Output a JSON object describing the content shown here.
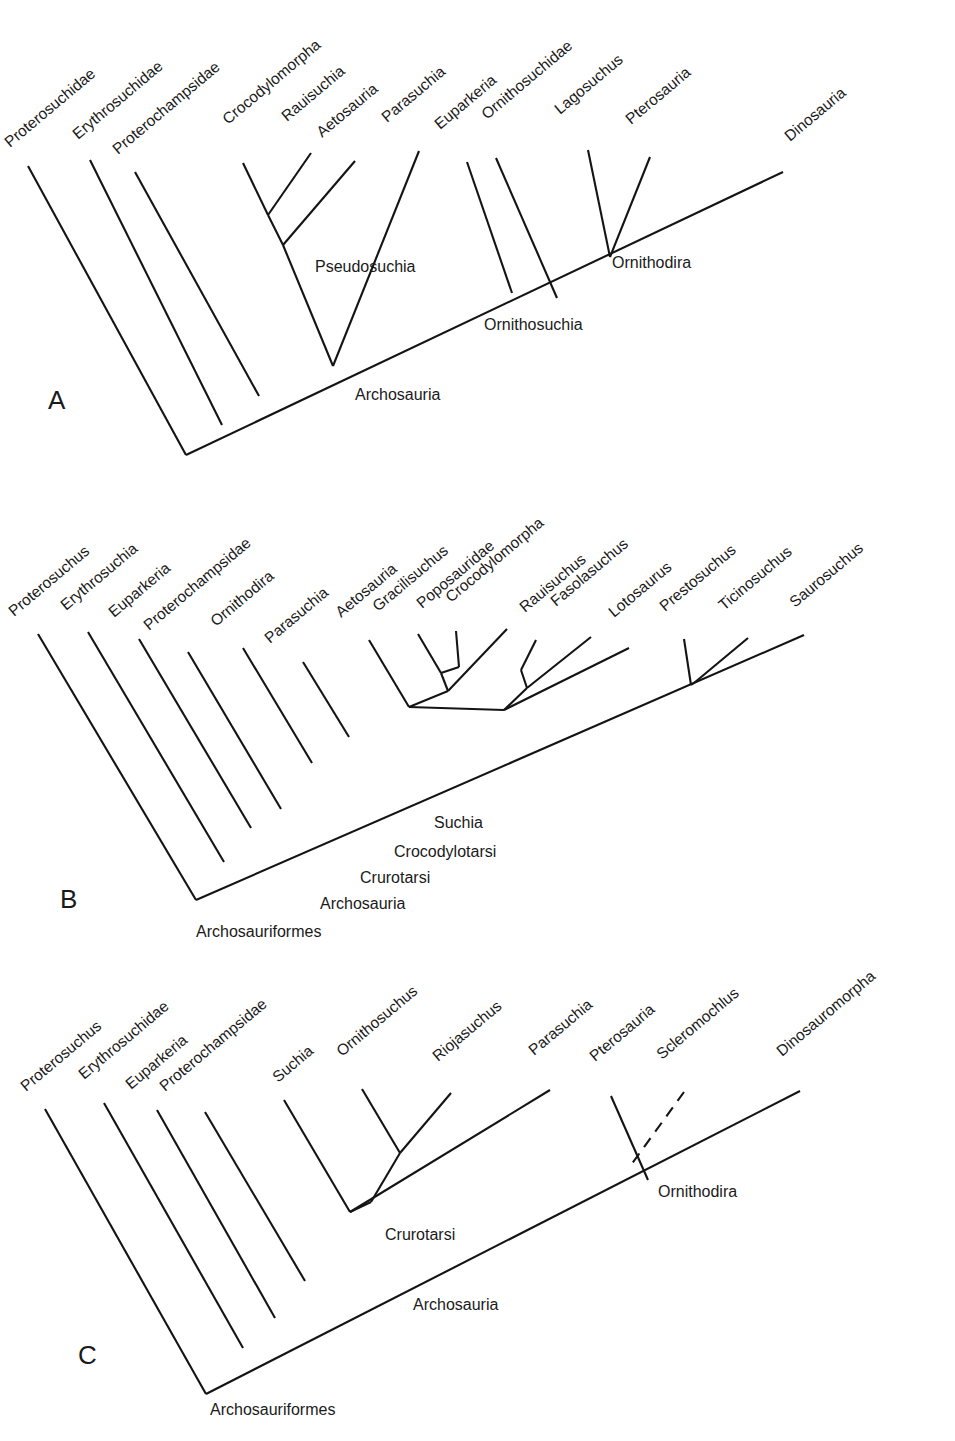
{
  "figure": {
    "type": "cladogram-figure",
    "panel_count": 3,
    "line_color": "#141414",
    "background": "#ffffff",
    "tip_label_rotation_deg": -40
  },
  "panels": [
    {
      "letter": "A",
      "letter_pos": {
        "x": 48,
        "y": 409
      },
      "tips": [
        {
          "label": "Proterosuchidae",
          "lx": 10,
          "ly": 148,
          "x1": 28,
          "y1": 166,
          "x2": 186,
          "y2": 455
        },
        {
          "label": "Erythrosuchidae",
          "lx": 78,
          "ly": 140,
          "x1": 90,
          "y1": 160,
          "x2": 222,
          "y2": 425
        },
        {
          "label": "Proterochampsidae",
          "lx": 118,
          "ly": 155,
          "x1": 135,
          "y1": 172,
          "x2": 259,
          "y2": 396
        },
        {
          "label": "Crocodylomorpha",
          "lx": 228,
          "ly": 125,
          "x1": 243,
          "y1": 163,
          "x2": 296,
          "y2": 263
        },
        {
          "label": "Rauisuchia",
          "lx": 287,
          "ly": 122,
          "x1": 311,
          "y1": 153,
          "x2": 268,
          "y2": 215
        },
        {
          "label": "Aetosauria",
          "lx": 322,
          "ly": 138,
          "x1": 355,
          "y1": 161,
          "x2": 283,
          "y2": 245
        },
        {
          "label": "Parasuchia",
          "lx": 387,
          "ly": 123,
          "x1": 419,
          "y1": 151,
          "x2": 333,
          "y2": 366
        },
        {
          "label": "Euparkeria",
          "lx": 440,
          "ly": 130,
          "x1": 467,
          "y1": 162,
          "x2": 512,
          "y2": 293
        },
        {
          "label": "Ornithosuchidae",
          "lx": 487,
          "ly": 120,
          "x1": 496,
          "y1": 158,
          "x2": 557,
          "y2": 298
        },
        {
          "label": "Lagosuchus",
          "lx": 560,
          "ly": 115,
          "x1": 588,
          "y1": 150,
          "x2": 608,
          "y2": 258
        },
        {
          "label": "Pterosauria",
          "lx": 631,
          "ly": 125,
          "x1": 650,
          "y1": 157,
          "x2": 610,
          "y2": 257
        },
        {
          "label": "Dinosauria",
          "lx": 790,
          "ly": 142,
          "x1": 783,
          "y1": 172,
          "x2": 186,
          "y2": 455
        }
      ],
      "nodes": [
        {
          "label": "Pseudosuchia",
          "x": 315,
          "y": 272
        },
        {
          "label": "Ornithosuchia",
          "x": 484,
          "y": 330
        },
        {
          "label": "Archosauria",
          "x": 355,
          "y": 400
        },
        {
          "label": "Ornithodira",
          "x": 612,
          "y": 268
        }
      ]
    },
    {
      "letter": "B",
      "letter_pos": {
        "x": 60,
        "y": 908
      },
      "tips": [
        {
          "label": "Proterosuchus",
          "lx": 14,
          "ly": 617,
          "x1": 38,
          "y1": 634,
          "x2": 196,
          "y2": 900
        },
        {
          "label": "Erythrosuchia",
          "lx": 66,
          "ly": 611,
          "x1": 88,
          "y1": 632,
          "x2": 224,
          "y2": 862
        },
        {
          "label": "Euparkeria",
          "lx": 114,
          "ly": 618,
          "x1": 139,
          "y1": 639,
          "x2": 251,
          "y2": 828
        },
        {
          "label": "Proterochampsidae",
          "lx": 149,
          "ly": 631,
          "x1": 188,
          "y1": 652,
          "x2": 281,
          "y2": 809
        },
        {
          "label": "Ornithodira",
          "lx": 216,
          "ly": 627,
          "x1": 243,
          "y1": 648,
          "x2": 312,
          "y2": 763
        },
        {
          "label": "Parasuchia",
          "lx": 270,
          "ly": 644,
          "x1": 303,
          "y1": 662,
          "x2": 349,
          "y2": 737
        },
        {
          "label": "Aetosauria",
          "lx": 341,
          "ly": 618,
          "x1": 369,
          "y1": 640,
          "x2": 409,
          "y2": 707
        },
        {
          "label": "Gracilisuchus",
          "lx": 378,
          "ly": 612,
          "x1": 418,
          "y1": 634,
          "x2": 441,
          "y2": 673
        },
        {
          "label": "Poposauridae",
          "lx": 422,
          "ly": 609,
          "x1": 456,
          "y1": 631,
          "x2": 459,
          "y2": 667
        },
        {
          "label": "Crocodylomorpha",
          "lx": 451,
          "ly": 603,
          "x1": 507,
          "y1": 629,
          "x2": 448,
          "y2": 691
        },
        {
          "label": "Rauisuchus",
          "lx": 525,
          "ly": 613,
          "x1": 536,
          "y1": 640,
          "x2": 521,
          "y2": 670
        },
        {
          "label": "Fasolasuchus",
          "lx": 556,
          "ly": 607,
          "x1": 591,
          "y1": 637,
          "x2": 527,
          "y2": 688
        },
        {
          "label": "Lotosaurus",
          "lx": 614,
          "ly": 618,
          "x1": 629,
          "y1": 648,
          "x2": 504,
          "y2": 710
        },
        {
          "label": "Prestosuchus",
          "lx": 665,
          "ly": 612,
          "x1": 684,
          "y1": 639,
          "x2": 691,
          "y2": 685
        },
        {
          "label": "Ticinosuchus",
          "lx": 724,
          "ly": 611,
          "x1": 748,
          "y1": 638,
          "x2": 694,
          "y2": 683
        },
        {
          "label": "Saurosuchus",
          "lx": 795,
          "ly": 608,
          "x1": 804,
          "y1": 635,
          "x2": 196,
          "y2": 900
        }
      ],
      "nodes": [
        {
          "label": "Suchia",
          "x": 434,
          "y": 828
        },
        {
          "label": "Crocodylotarsi",
          "x": 394,
          "y": 857
        },
        {
          "label": "Crurotarsi",
          "x": 360,
          "y": 883
        },
        {
          "label": "Archosauria",
          "x": 320,
          "y": 909
        },
        {
          "label": "Archosauriformes",
          "x": 196,
          "y": 937
        }
      ]
    },
    {
      "letter": "C",
      "letter_pos": {
        "x": 78,
        "y": 1364
      },
      "tips": [
        {
          "label": "Proterosuchus",
          "lx": 26,
          "ly": 1092,
          "x1": 45,
          "y1": 1109,
          "x2": 206,
          "y2": 1394
        },
        {
          "label": "Erythrosuchidae",
          "lx": 84,
          "ly": 1080,
          "x1": 104,
          "y1": 1103,
          "x2": 243,
          "y2": 1348
        },
        {
          "label": "Euparkeria",
          "lx": 131,
          "ly": 1090,
          "x1": 157,
          "y1": 1110,
          "x2": 275,
          "y2": 1318
        },
        {
          "label": "Proterochampsidae",
          "lx": 165,
          "ly": 1092,
          "x1": 205,
          "y1": 1112,
          "x2": 305,
          "y2": 1281
        },
        {
          "label": "Suchia",
          "lx": 278,
          "ly": 1083,
          "x1": 284,
          "y1": 1100,
          "x2": 350,
          "y2": 1212
        },
        {
          "label": "Ornithosuchus",
          "lx": 342,
          "ly": 1057,
          "x1": 362,
          "y1": 1089,
          "x2": 400,
          "y2": 1153
        },
        {
          "label": "Riojasuchus",
          "lx": 438,
          "ly": 1062,
          "x1": 451,
          "y1": 1093,
          "x2": 371,
          "y2": 1202
        },
        {
          "label": "Parasuchia",
          "lx": 534,
          "ly": 1056,
          "x1": 550,
          "y1": 1090,
          "x2": 350,
          "y2": 1212
        },
        {
          "label": "Pterosauria",
          "lx": 595,
          "ly": 1062,
          "x1": 611,
          "y1": 1096,
          "x2": 648,
          "y2": 1180
        },
        {
          "label": "Scleromochlus",
          "lx": 662,
          "ly": 1060,
          "x1": 684,
          "y1": 1092,
          "x2": 631,
          "y2": 1165
        },
        {
          "label": "Dinosauromorpha",
          "lx": 782,
          "ly": 1057,
          "x1": 800,
          "y1": 1091,
          "x2": 206,
          "y2": 1394
        }
      ],
      "nodes": [
        {
          "label": "Ornithodira",
          "x": 658,
          "y": 1197
        },
        {
          "label": "Crurotarsi",
          "x": 385,
          "y": 1240
        },
        {
          "label": "Archosauria",
          "x": 413,
          "y": 1310
        },
        {
          "label": "Archosauriformes",
          "x": 210,
          "y": 1415
        }
      ],
      "dashed_tip": "Scleromochlus"
    }
  ]
}
